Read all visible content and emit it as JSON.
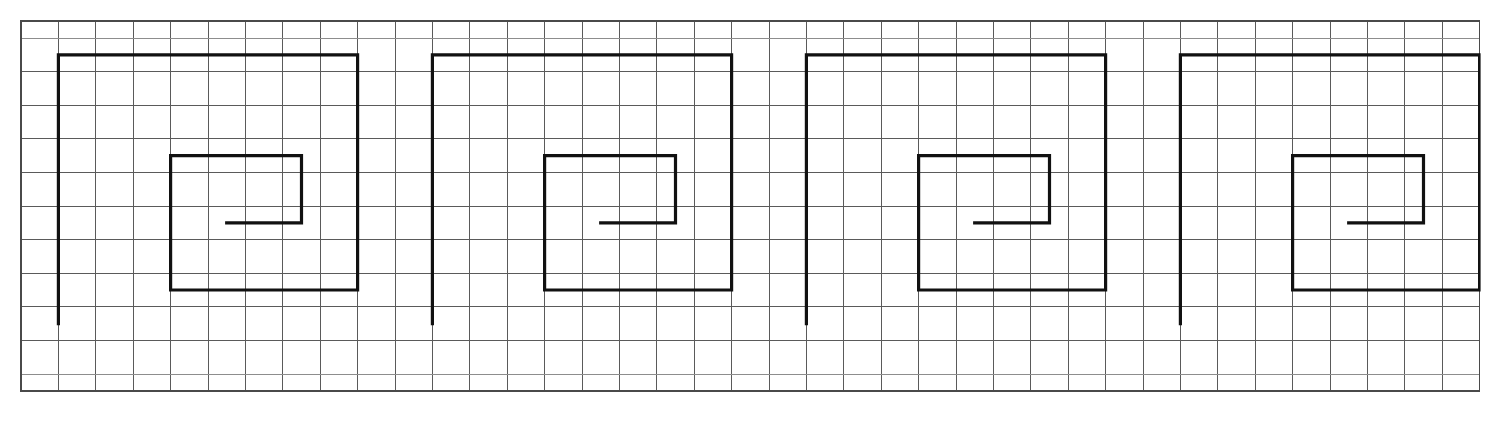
{
  "caption": {
    "text": "Greek key border design"
  },
  "figure": {
    "name": "greek-key-border-grid-drawing",
    "colors": {
      "background": "#ffffff",
      "grid_line": "#5a5a5a",
      "grid_line_faint": "#8d8d8d",
      "grid_border": "#4a4a4a",
      "motif_stroke": "#111111"
    },
    "grid": {
      "origin_x": 21,
      "origin_y": 21,
      "cell_width": 37.4,
      "cell_height": 33.6,
      "columns": 39,
      "rows": 12,
      "top_half_row_height": 17,
      "bottom_half_row_height": 17,
      "line_width": 1,
      "border_line_width": 1.2
    },
    "motif": {
      "type": "greek-key-meander-spiral",
      "repeat_count": 4,
      "period_cells": 10,
      "start_col": 1,
      "stroke_width": 3.2,
      "path_cells": [
        [
          1,
          9.5
        ],
        [
          1,
          1.5
        ],
        [
          9,
          1.5
        ],
        [
          9,
          8.5
        ],
        [
          4,
          8.5
        ],
        [
          4,
          4.5
        ],
        [
          7.5,
          4.5
        ],
        [
          7.5,
          6.5
        ],
        [
          5.5,
          6.5
        ]
      ]
    }
  }
}
